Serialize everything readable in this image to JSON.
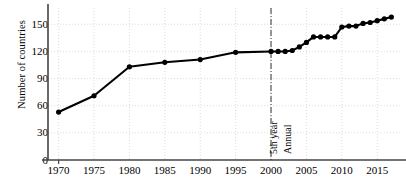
{
  "chart_data": {
    "type": "line",
    "title": "",
    "xlabel": "",
    "ylabel": "Number of countries",
    "xlim": [
      1968.5,
      2018.5
    ],
    "ylim": [
      0,
      168
    ],
    "yticks": [
      0,
      30,
      60,
      90,
      120,
      150
    ],
    "xticks": [
      1970,
      1975,
      1980,
      1985,
      1990,
      1995,
      2000,
      2005,
      2010,
      2015
    ],
    "grid": true,
    "legend": null,
    "marker": "filled-circle",
    "line_color": "#000000",
    "grid_color": "#cccccc",
    "axis_color": "#444444",
    "series": [
      {
        "name": "Number of countries",
        "x": [
          1970,
          1975,
          1980,
          1985,
          1990,
          1995,
          2000,
          2001,
          2002,
          2003,
          2004,
          2005,
          2006,
          2007,
          2008,
          2009,
          2010,
          2011,
          2012,
          2013,
          2014,
          2015,
          2016,
          2017
        ],
        "values": [
          53,
          71,
          103,
          108,
          111,
          119,
          120,
          120,
          120,
          121,
          125,
          130,
          136,
          136,
          136,
          136,
          147,
          148,
          148,
          151,
          152,
          154,
          156,
          158
        ]
      }
    ],
    "annotations": [
      {
        "name": "period-divider",
        "type": "vline",
        "x": 2000,
        "style": "dash-dot"
      },
      {
        "name": "left-period-label",
        "text": "5th year",
        "x": 2000,
        "rotated": true
      },
      {
        "name": "right-period-label",
        "text": "Annual",
        "x": 2000,
        "rotated": true
      }
    ]
  },
  "axis": {
    "ylabel": "Number of countries",
    "yticks": [
      "0",
      "30",
      "60",
      "90",
      "120",
      "150"
    ],
    "xticks": [
      "1970",
      "1975",
      "1980",
      "1985",
      "1990",
      "1995",
      "2000",
      "2005",
      "2010",
      "2015"
    ]
  },
  "annotations": {
    "left_label": "5th year",
    "right_label": "Annual"
  }
}
